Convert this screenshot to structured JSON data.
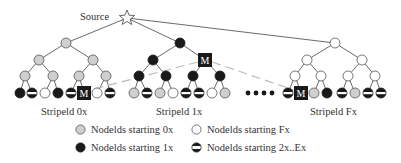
{
  "source": {
    "label": "Source",
    "icon": "star-icon"
  },
  "colors": {
    "nodeid_0x": "#cfcfcf",
    "nodeid_1x": "#1a1a1a",
    "nodeid_Fx": "#ffffff",
    "stroke": "#555555",
    "dashed": "#bbbbbb",
    "m_box": "#1a1a1a"
  },
  "stripes": [
    {
      "label": "Stripeld 0x",
      "node_type": "0x",
      "internal": [
        "0x",
        "0x",
        "0x",
        "0x",
        "0x",
        "0x",
        "0x"
      ],
      "leaves": [
        "1x",
        "2x..Ex",
        "Fx",
        "1x",
        "2x..Ex",
        "M",
        "Fx",
        "2x..Ex"
      ]
    },
    {
      "label": "Stripeld 1x",
      "node_type": "1x",
      "internal": [
        "1x",
        "1x",
        "M",
        "1x",
        "1x",
        "1x",
        "1x"
      ],
      "leaves": [
        "0x",
        "2x..Ex",
        "0x",
        "Fx",
        "2x..Ex",
        "2x..Ex",
        "Fx",
        "0x"
      ]
    },
    {
      "label": "Stripeld Fx",
      "node_type": "Fx",
      "internal": [
        "Fx",
        "Fx",
        "Fx",
        "Fx",
        "Fx",
        "Fx",
        "Fx"
      ],
      "leaves": [
        "2x..Ex",
        "M",
        "0x",
        "1x",
        "2x..Ex",
        "0x",
        "2x..Ex",
        "2x..Ex"
      ]
    }
  ],
  "ellipsis": "••••",
  "m_label": "M",
  "legend": [
    {
      "label": "Nodelds starting 0x",
      "swatch": "0x"
    },
    {
      "label": "Nodelds starting Fx",
      "swatch": "Fx"
    },
    {
      "label": "Nodelds starting 1x",
      "swatch": "1x"
    },
    {
      "label": "Nodelds starting 2x..Ex",
      "swatch": "2x..Ex"
    }
  ]
}
